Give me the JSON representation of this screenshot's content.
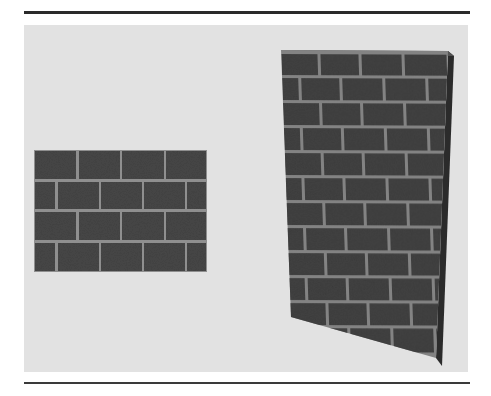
{
  "figure": {
    "colors": {
      "background": "#ffffff",
      "canvas": "#e2e2e2",
      "rule": "#2a2a2a",
      "brick": "#4a4a4a",
      "brick_dark": "#3a3a3a",
      "mortar": "#9a9a9a",
      "side_face": "#2e2e2e"
    },
    "flat_texture": {
      "label": "brick-texture",
      "rows": 4,
      "bricks_per_row": 4,
      "offset_rows": [
        1,
        3
      ]
    },
    "wall_3d": {
      "label": "textured-wall",
      "rows": 12,
      "bricks_per_row": 4
    }
  }
}
